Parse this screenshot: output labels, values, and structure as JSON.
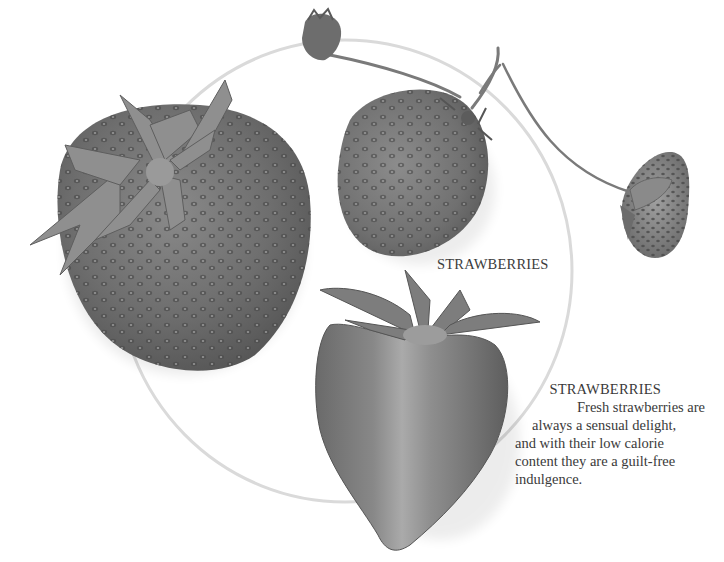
{
  "page": {
    "background": "#ffffff",
    "circle_color": "#d9d9d9"
  },
  "photo": {
    "subject": "strawberries",
    "label": "STRAWBERRIES",
    "items": [
      {
        "name": "large-whole-strawberry"
      },
      {
        "name": "medium-whole-strawberry"
      },
      {
        "name": "halved-strawberry"
      },
      {
        "name": "small-wild-strawberry"
      },
      {
        "name": "strawberry-bud"
      }
    ]
  },
  "caption": {
    "title": "STRAWBERRIES",
    "lines": [
      "Fresh strawberries are",
      "always a sensual delight,",
      "and with their low calorie",
      "content they are a guilt-free",
      "indulgence."
    ]
  }
}
